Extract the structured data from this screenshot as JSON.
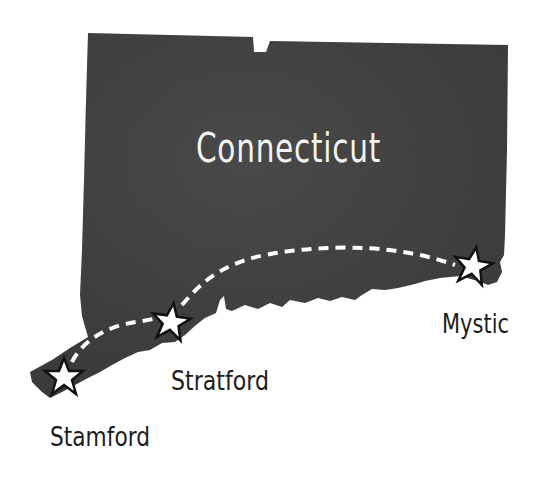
{
  "map": {
    "state_name": "Connecticut",
    "colors": {
      "land": "#3b3b3b",
      "land_texture": "#454545",
      "background": "#ffffff",
      "route": "#ffffff",
      "star_fill": "#ffffff",
      "star_stroke": "#111111",
      "label": "#1c1c1c"
    },
    "route": {
      "style": "dashed",
      "stops": [
        "Stamford",
        "Stratford",
        "Mystic"
      ]
    },
    "cities": [
      {
        "name": "Stamford",
        "icon": "star-icon"
      },
      {
        "name": "Stratford",
        "icon": "star-icon"
      },
      {
        "name": "Mystic",
        "icon": "star-icon"
      }
    ]
  }
}
